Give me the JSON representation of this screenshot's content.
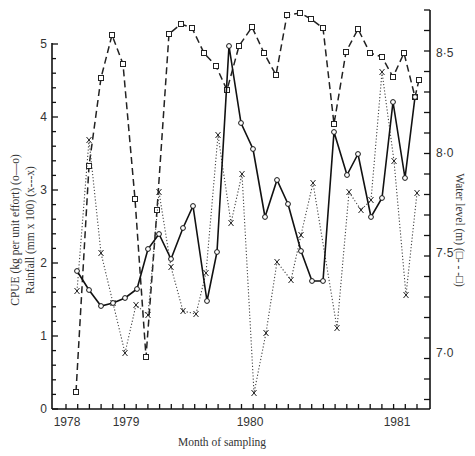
{
  "chart_data": {
    "type": "line",
    "title": "",
    "xlabel": "Month of sampling",
    "ylabel_left_1": "CPUE (kg per unit effort) (o—o)",
    "ylabel_left_2": "Rainfall (mm x 100) (x---x)",
    "ylabel_right": "Water level (m) (□- - -□)",
    "x_tick_labels": [
      "1978",
      "1979",
      "1980",
      "1981"
    ],
    "y_left_ticks": [
      "0",
      "1",
      "2",
      "3",
      "4",
      "5"
    ],
    "y_left_range": [
      0,
      5
    ],
    "y_right_ticks": [
      "7·0",
      "7·5",
      "8·0",
      "8·5"
    ],
    "y_right_range": [
      6.72,
      8.7
    ],
    "grid": false,
    "legend": "encoded in axis titles",
    "series": [
      {
        "name": "CPUE (kg per unit effort)",
        "axis": "left",
        "marker": "circle",
        "style": "solid",
        "points_px": [
          [
            77,
            271
          ],
          [
            89,
            290
          ],
          [
            101,
            306
          ],
          [
            113,
            303
          ],
          [
            125,
            298
          ],
          [
            137,
            289
          ],
          [
            148,
            249
          ],
          [
            159,
            234
          ],
          [
            171,
            259
          ],
          [
            183,
            228
          ],
          [
            193,
            206
          ],
          [
            207,
            301
          ],
          [
            217,
            252
          ],
          [
            229,
            46
          ],
          [
            241,
            123
          ],
          [
            253,
            149
          ],
          [
            265,
            217
          ],
          [
            277,
            180
          ],
          [
            288,
            204
          ],
          [
            301,
            251
          ],
          [
            312,
            281
          ],
          [
            323,
            281
          ],
          [
            334,
            132
          ],
          [
            347,
            175
          ],
          [
            358,
            154
          ],
          [
            371,
            217
          ],
          [
            382,
            198
          ],
          [
            393,
            102
          ],
          [
            405,
            178
          ],
          [
            415,
            97
          ]
        ],
        "values": [
          1.88,
          1.62,
          1.4,
          1.44,
          1.51,
          1.63,
          2.18,
          2.38,
          2.04,
          2.47,
          2.77,
          1.47,
          2.14,
          4.96,
          3.9,
          3.55,
          2.62,
          3.12,
          2.79,
          2.15,
          1.74,
          1.74,
          3.78,
          3.19,
          3.48,
          2.62,
          2.88,
          4.19,
          3.15,
          4.26
        ]
      },
      {
        "name": "Rainfall (mm x 100)",
        "axis": "left",
        "marker": "x",
        "style": "dotted",
        "points_px": [
          [
            77,
            291
          ],
          [
            89,
            140
          ],
          [
            101,
            253
          ],
          [
            113,
            303
          ],
          [
            125,
            353
          ],
          [
            136,
            305
          ],
          [
            148,
            315
          ],
          [
            159,
            192
          ],
          [
            171,
            267
          ],
          [
            183,
            311
          ],
          [
            196,
            314
          ],
          [
            206,
            273
          ],
          [
            218,
            135
          ],
          [
            231,
            223
          ],
          [
            242,
            174
          ],
          [
            254,
            393
          ],
          [
            266,
            333
          ],
          [
            277,
            262
          ],
          [
            291,
            280
          ],
          [
            301,
            235
          ],
          [
            313,
            183
          ],
          [
            337,
            328
          ],
          [
            349,
            192
          ],
          [
            361,
            210
          ],
          [
            371,
            200
          ],
          [
            382,
            72
          ],
          [
            394,
            161
          ],
          [
            406,
            295
          ],
          [
            417,
            193
          ]
        ],
        "values": [
          1.6,
          3.67,
          2.12,
          1.44,
          0.75,
          1.41,
          1.27,
          2.96,
          1.93,
          1.33,
          1.29,
          1.85,
          3.74,
          2.53,
          3.21,
          0.21,
          1.03,
          2.0,
          1.75,
          2.37,
          3.08,
          1.1,
          2.96,
          2.71,
          2.85,
          4.6,
          3.38,
          1.55,
          2.95
        ]
      },
      {
        "name": "Water level (m)",
        "axis": "right",
        "marker": "square",
        "style": "dashed",
        "points_px": [
          [
            76,
            392
          ],
          [
            89,
            166
          ],
          [
            101,
            78
          ],
          [
            112,
            35
          ],
          [
            123,
            64
          ],
          [
            135,
            199
          ],
          [
            146,
            357
          ],
          [
            157,
            210
          ],
          [
            169,
            34
          ],
          [
            181,
            24
          ],
          [
            192,
            28
          ],
          [
            204,
            53
          ],
          [
            216,
            66
          ],
          [
            227,
            90
          ],
          [
            239,
            46
          ],
          [
            252,
            27
          ],
          [
            264,
            53
          ],
          [
            276,
            75
          ],
          [
            287,
            15
          ],
          [
            300,
            13
          ],
          [
            311,
            19
          ],
          [
            323,
            28
          ],
          [
            334,
            124
          ],
          [
            346,
            52
          ],
          [
            358,
            29
          ],
          [
            370,
            53
          ],
          [
            382,
            57
          ],
          [
            393,
            77
          ],
          [
            404,
            53
          ],
          [
            415,
            97
          ],
          [
            419,
            80
          ]
        ],
        "values": [
          6.8,
          7.93,
          8.37,
          8.58,
          8.44,
          7.76,
          6.97,
          7.71,
          8.59,
          8.64,
          8.62,
          8.5,
          8.43,
          8.31,
          8.53,
          8.63,
          8.5,
          8.39,
          8.69,
          8.7,
          8.67,
          8.62,
          8.14,
          8.5,
          8.62,
          8.5,
          8.48,
          8.38,
          8.5,
          8.28,
          8.36
        ]
      }
    ]
  },
  "axes": {
    "x_title": "Month of sampling",
    "left_title_1": "CPUE (kg per unit effort) (o—o)",
    "left_title_2": "Rainfall (mm x 100) (x---x)",
    "right_title": "Water level (m) (□- - -□)",
    "x_labels": [
      "1978",
      "1979",
      "1980",
      "1981"
    ],
    "left_labels": [
      "0",
      "1",
      "2",
      "3",
      "4",
      "5"
    ],
    "right_labels": [
      "7·0",
      "7·5",
      "8·0",
      "8·5"
    ]
  }
}
